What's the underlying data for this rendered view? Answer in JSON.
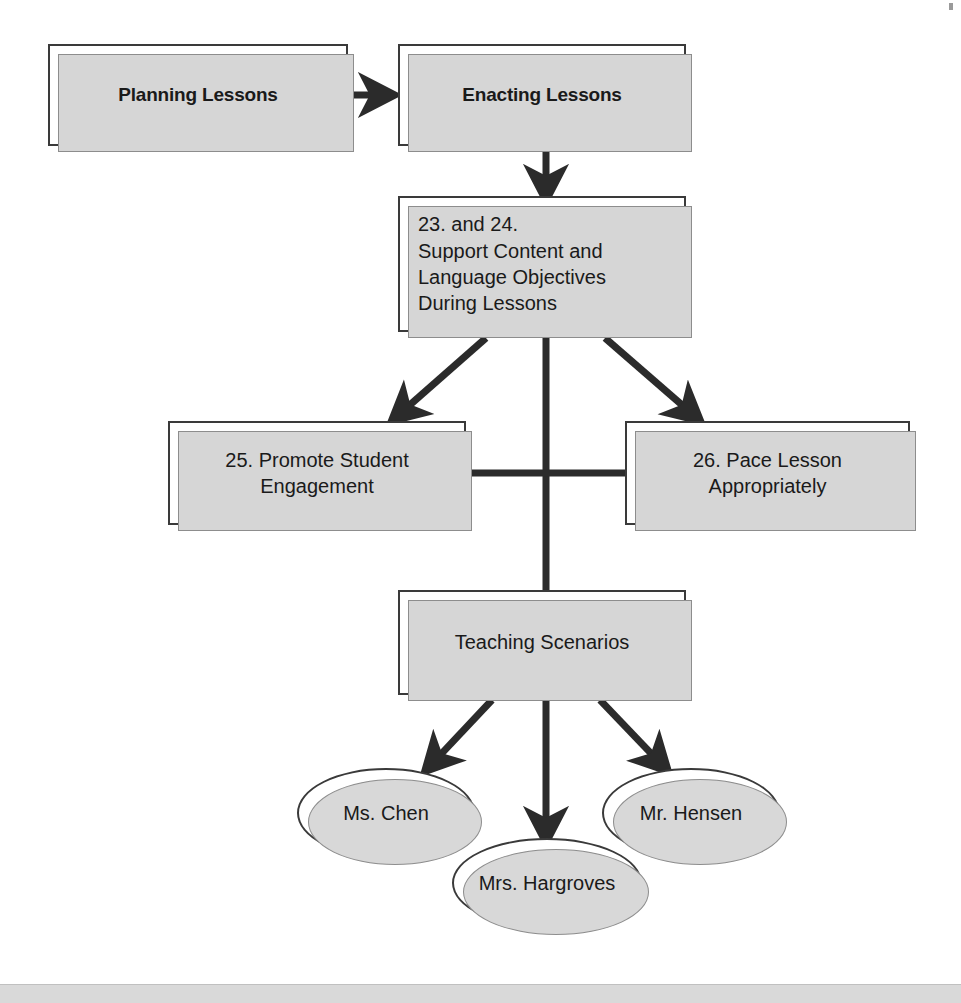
{
  "diagram": {
    "colors": {
      "node_border": "#3a3a3a",
      "node_fill": "#ffffff",
      "shadow": "#d6d6d6",
      "connector": "#2b2b2b",
      "footer": "#d9d9d9",
      "text": "#1a1a1a"
    },
    "nodes": [
      {
        "id": "planning-lessons",
        "shape": "rect",
        "label": "Planning Lessons",
        "style": "bold"
      },
      {
        "id": "enacting-lessons",
        "shape": "rect",
        "label": "Enacting Lessons",
        "style": "bold"
      },
      {
        "id": "support-objectives",
        "shape": "rect",
        "label": "23. and 24.\n    Support Content and\n    Language Objectives\n    During Lessons",
        "style": "plain"
      },
      {
        "id": "promote-engagement",
        "shape": "rect",
        "label": "25.  Promote Student\nEngagement",
        "style": "plain"
      },
      {
        "id": "pace-lesson",
        "shape": "rect",
        "label": "26.  Pace Lesson\nAppropriately",
        "style": "plain"
      },
      {
        "id": "teaching-scenarios",
        "shape": "rect",
        "label": "Teaching Scenarios",
        "style": "plain"
      },
      {
        "id": "ms-chen",
        "shape": "ellipse",
        "label": "Ms. Chen",
        "style": "plain"
      },
      {
        "id": "mrs-hargroves",
        "shape": "ellipse",
        "label": "Mrs. Hargroves",
        "style": "plain"
      },
      {
        "id": "mr-hensen",
        "shape": "ellipse",
        "label": "Mr. Hensen",
        "style": "plain"
      }
    ],
    "edges": [
      {
        "from": "planning-lessons",
        "to": "enacting-lessons",
        "arrow": true,
        "kind": "horizontal"
      },
      {
        "from": "enacting-lessons",
        "to": "support-objectives",
        "arrow": true,
        "kind": "vertical"
      },
      {
        "from": "support-objectives",
        "to": "promote-engagement",
        "arrow": true,
        "kind": "diagonal-left"
      },
      {
        "from": "support-objectives",
        "to": "pace-lesson",
        "arrow": true,
        "kind": "diagonal-right"
      },
      {
        "from": "support-objectives",
        "to": "teaching-scenarios",
        "arrow": false,
        "kind": "vertical"
      },
      {
        "from": "promote-engagement",
        "to": "pace-lesson",
        "arrow": false,
        "kind": "horizontal-crossbar"
      },
      {
        "from": "teaching-scenarios",
        "to": "ms-chen",
        "arrow": true,
        "kind": "diagonal-left"
      },
      {
        "from": "teaching-scenarios",
        "to": "mrs-hargroves",
        "arrow": true,
        "kind": "vertical"
      },
      {
        "from": "teaching-scenarios",
        "to": "mr-hensen",
        "arrow": true,
        "kind": "diagonal-right"
      }
    ]
  }
}
